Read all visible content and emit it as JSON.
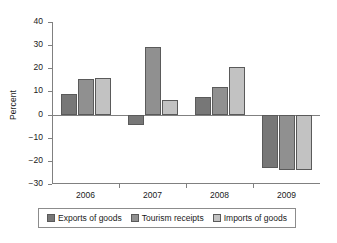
{
  "chart_data": {
    "type": "bar",
    "title": "",
    "xlabel": "",
    "ylabel": "Percent",
    "categories": [
      "2006",
      "2007",
      "2008",
      "2009"
    ],
    "series": [
      {
        "name": "Exports of goods",
        "color": "#777777",
        "values": [
          9,
          -4.5,
          7.7,
          -23.2
        ]
      },
      {
        "name": "Tourism receipts",
        "color": "#909090",
        "values": [
          15.5,
          29,
          11.7,
          -24
        ]
      },
      {
        "name": "Imports of goods",
        "color": "#c2c2c2",
        "values": [
          16,
          6.3,
          20.7,
          -24
        ]
      }
    ],
    "ylim": [
      -30,
      40
    ],
    "ytick_values": [
      40,
      30,
      20,
      10,
      0,
      -10,
      -20,
      -30
    ],
    "ytick_labels": [
      "40",
      "30",
      "20",
      "10",
      "0",
      "−10",
      "−20",
      "−30"
    ],
    "grid": false,
    "legend_position": "bottom",
    "zero_line": true
  },
  "legend": {
    "entries": [
      {
        "label": "Exports of goods"
      },
      {
        "label": "Tourism receipts"
      },
      {
        "label": "Imports of goods"
      }
    ]
  }
}
